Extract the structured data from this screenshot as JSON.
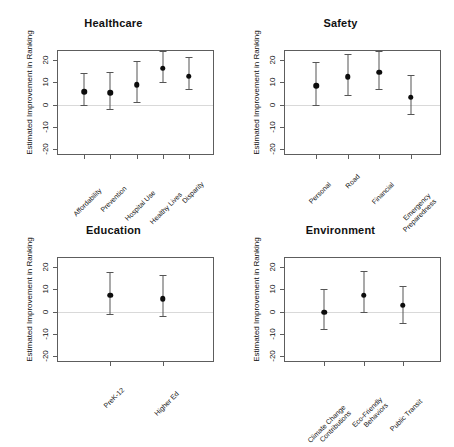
{
  "figure": {
    "ylabel": "Estimated Improvement in Ranking",
    "ytick_labels": [
      "20",
      "10",
      "0",
      "-10",
      "-20"
    ]
  },
  "chart_data": {
    "type": "scatter",
    "title": "",
    "xlabel": "",
    "ylabel": "Estimated Improvement in Ranking",
    "ylim": [
      -23,
      24
    ],
    "yticks": [
      20,
      10,
      0,
      -10,
      -20
    ],
    "grid": false,
    "legend": "none",
    "annotations": "Horizontal gray reference line at y = 0 in each panel; points are estimates with vertical capped error bars (confidence intervals).",
    "panels": [
      {
        "title": "Healthcare",
        "categories": [
          "Affordability",
          "Prevention",
          "Hospital Use",
          "Healthy Lives",
          "Disparity"
        ],
        "values": [
          7.0,
          6.6,
          10.2,
          17.4,
          14.0
        ],
        "ci_low": [
          0.0,
          -1.8,
          1.0,
          10.2,
          7.0
        ],
        "ci_high": [
          14.2,
          14.6,
          19.6,
          23.8,
          21.2
        ]
      },
      {
        "title": "Safety",
        "categories": [
          "Personal",
          "Road",
          "Financial",
          "Emergency Preparedness"
        ],
        "values": [
          9.7,
          13.8,
          15.7,
          4.5
        ],
        "ci_low": [
          0.0,
          4.4,
          7.0,
          -4.2
        ],
        "ci_high": [
          19.2,
          22.8,
          24.2,
          13.4
        ]
      },
      {
        "title": "Education",
        "categories": [
          "PreK-12",
          "Higher Ed"
        ],
        "values": [
          8.5,
          7.0
        ],
        "ci_low": [
          -1.0,
          -2.0
        ],
        "ci_high": [
          17.6,
          16.4
        ]
      },
      {
        "title": "Environment",
        "categories": [
          "Climate Change Contributions",
          "Eco-Friendly Behaviors",
          "Public Transit"
        ],
        "values": [
          1.0,
          8.5,
          4.0
        ],
        "ci_low": [
          -8.0,
          0.0,
          -5.0
        ],
        "ci_high": [
          10.2,
          18.2,
          11.6
        ]
      }
    ]
  }
}
